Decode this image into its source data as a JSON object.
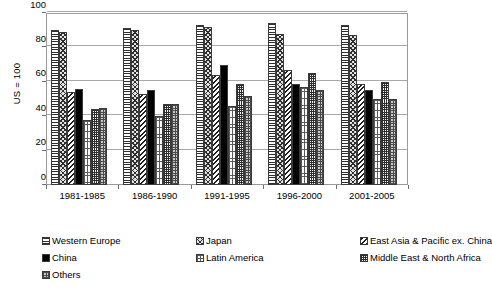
{
  "chart_data": {
    "type": "bar",
    "title": "",
    "subtitle": "",
    "xlabel": "",
    "ylabel": "US = 100",
    "ylim": [
      0,
      100
    ],
    "yticks": [
      0,
      20,
      40,
      60,
      80,
      100
    ],
    "grid": true,
    "legend_position": "bottom",
    "categories": [
      "1981-1985",
      "1986-1990",
      "1991-1995",
      "1996-2000",
      "2001-2005"
    ],
    "series": [
      {
        "name": "Western Europe",
        "pattern": "horizontal-lines",
        "color": "#dcdcdc",
        "values": [
          90,
          91,
          93,
          94,
          93
        ]
      },
      {
        "name": "Japan",
        "pattern": "diagonal-crosshatch",
        "color": "#e2e2e2",
        "values": [
          89,
          90,
          92,
          88,
          87
        ]
      },
      {
        "name": "East Asia & Pacific ex. China",
        "pattern": "diagonal-stripes",
        "color": "#ffffff",
        "values": [
          54,
          53,
          64,
          67,
          59
        ]
      },
      {
        "name": "China",
        "pattern": "solid-black",
        "color": "#000000",
        "values": [
          56,
          55,
          70,
          59,
          55
        ]
      },
      {
        "name": "Latin America",
        "pattern": "light-dots",
        "color": "#ffffff",
        "values": [
          38,
          40,
          46,
          57,
          50
        ]
      },
      {
        "name": "Middle East & North Africa",
        "pattern": "fine-grid",
        "color": "#f2f2f2",
        "values": [
          44,
          47,
          59,
          65,
          60
        ]
      },
      {
        "name": "Others",
        "pattern": "coarse-grid",
        "color": "#c9c9c9",
        "values": [
          45,
          47,
          52,
          55,
          50
        ]
      }
    ]
  },
  "axes": {
    "y_title": "US = 100",
    "y_tick_labels": [
      "100",
      "80",
      "60",
      "40",
      "20",
      "0"
    ],
    "x_tick_labels": [
      "1981-1985",
      "1986-1990",
      "1991-1995",
      "1996-2000",
      "2001-2005"
    ]
  },
  "legend": {
    "entries": [
      {
        "label": "Western Europe",
        "pattern_class": "pat-western-europe"
      },
      {
        "label": "Japan",
        "pattern_class": "pat-japan"
      },
      {
        "label": "East Asia & Pacific ex. China",
        "pattern_class": "pat-east-asia-pacific"
      },
      {
        "label": "China",
        "pattern_class": "pat-china"
      },
      {
        "label": "Latin America",
        "pattern_class": "pat-latin-america"
      },
      {
        "label": "Middle East & North Africa",
        "pattern_class": "pat-middle-east-north-africa"
      },
      {
        "label": "Others",
        "pattern_class": "pat-others"
      }
    ]
  },
  "style": {
    "axis_color": "#9a9a9a",
    "gridline_color": "#a8a8a8",
    "text_color": "#000000",
    "background": "#ffffff"
  }
}
